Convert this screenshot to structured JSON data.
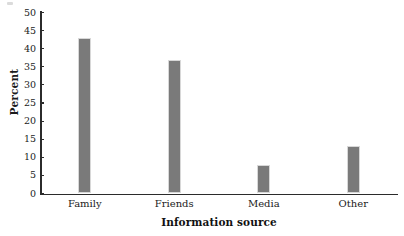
{
  "chart_data": {
    "type": "bar",
    "title": "",
    "categories": [
      "Family",
      "Friends",
      "Media",
      "Other"
    ],
    "values": [
      43,
      37,
      8,
      13
    ],
    "series": [
      {
        "name": "Percent",
        "values": [
          43,
          37,
          8,
          13
        ]
      }
    ],
    "xlabel": "Information source",
    "ylabel": "Percent",
    "ylim": [
      0,
      50
    ],
    "ytick_step": 5,
    "yticks": [
      0,
      5,
      10,
      15,
      20,
      25,
      30,
      35,
      40,
      45,
      50
    ],
    "ytick_labels": [
      "0",
      "5",
      "10",
      "15",
      "20",
      "25",
      "30",
      "35",
      "40",
      "45",
      "50"
    ],
    "grid": false,
    "legend": false,
    "legend_position": "none",
    "bar_color": "#7a7a7a",
    "axis_color": "#2b2b2b",
    "background_color": "#ffffff"
  }
}
